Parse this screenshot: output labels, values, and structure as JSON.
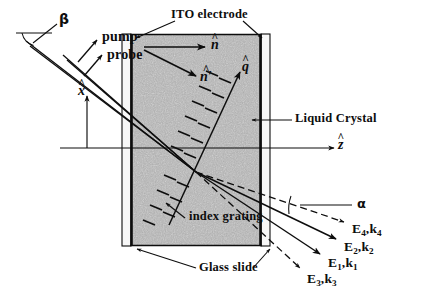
{
  "figure": {
    "domain": "diagram",
    "background_color": "#ffffff",
    "ink_color": "#0d0d0d",
    "cell_fill_color": "#a8a8a8",
    "glass_fill_color": "#f2f2f2"
  },
  "labels": {
    "beta": "β",
    "alpha": "α",
    "pump": "pump",
    "probe": "probe",
    "ito_electrode": "ITO electrode",
    "liquid_crystal": "Liquid Crystal",
    "index_grating": "index grating",
    "glass_slide": "Glass slide"
  },
  "vectors": {
    "x_hat": {
      "symbol": "x",
      "hat": "^",
      "name": "x-unit-vector"
    },
    "z_hat": {
      "symbol": "z",
      "hat": "^",
      "name": "z-unit-vector"
    },
    "n_hat": {
      "symbol": "n",
      "hat": "^",
      "name": "director"
    },
    "n_hat_prime": {
      "symbol": "n′",
      "hat": "^",
      "name": "perturbed-director"
    },
    "q_hat": {
      "symbol": "q",
      "hat": "^",
      "name": "grating-wavevector"
    }
  },
  "beams": [
    {
      "id": "beam4",
      "field": "E",
      "field_sub": "4",
      "wave": "k",
      "wave_sub": "4",
      "style": "dashed"
    },
    {
      "id": "beam2",
      "field": "E",
      "field_sub": "2",
      "wave": "k",
      "wave_sub": "2",
      "style": "solid"
    },
    {
      "id": "beam1",
      "field": "E",
      "field_sub": "1",
      "wave": "k",
      "wave_sub": "1",
      "style": "solid"
    },
    {
      "id": "beam3",
      "field": "E",
      "field_sub": "3",
      "wave": "k",
      "wave_sub": "3",
      "style": "dashed"
    }
  ],
  "geometry": {
    "cell": {
      "x": 130,
      "y": 34,
      "width": 132,
      "height": 212
    },
    "left_glass": {
      "x": 124,
      "y": 34,
      "width": 10,
      "height": 212
    },
    "right_glass": {
      "x": 254,
      "y": 34,
      "width": 10,
      "height": 212
    },
    "focus_point": {
      "x": 196,
      "y": 172
    },
    "axis_origin": {
      "x": 87,
      "y": 148
    }
  }
}
